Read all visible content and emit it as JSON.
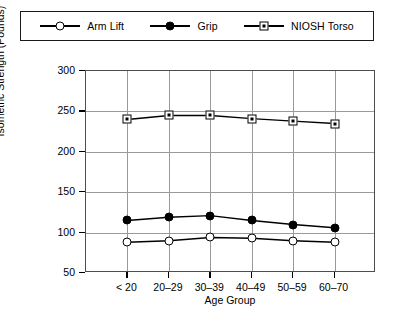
{
  "chart_data": {
    "type": "line",
    "title": "",
    "xlabel": "Age Group",
    "ylabel": "Isometric Strength (Pounds)",
    "categories": [
      "< 20",
      "20–29",
      "30–39",
      "40–49",
      "50–59",
      "60–70"
    ],
    "ylim": [
      50,
      300
    ],
    "yticks": [
      50,
      100,
      150,
      200,
      250,
      300
    ],
    "ytick_labels": [
      "50",
      "100",
      "150",
      "200",
      "250",
      "300"
    ],
    "grid": "both",
    "legend_position": "top-outside",
    "series": [
      {
        "name": "Arm Lift",
        "marker": "open-circle",
        "values": [
          88,
          90,
          94,
          93,
          90,
          88
        ]
      },
      {
        "name": "Grip",
        "marker": "filled-circle",
        "values": [
          115,
          119,
          121,
          115,
          110,
          106
        ]
      },
      {
        "name": "NIOSH Torso",
        "marker": "dotted-square",
        "values": [
          240,
          245,
          245,
          241,
          238,
          235
        ]
      }
    ],
    "colors": {
      "line": "#000000",
      "grid": "#9a9a9a",
      "axis": "#4d4d4d",
      "background": "#ffffff"
    }
  }
}
